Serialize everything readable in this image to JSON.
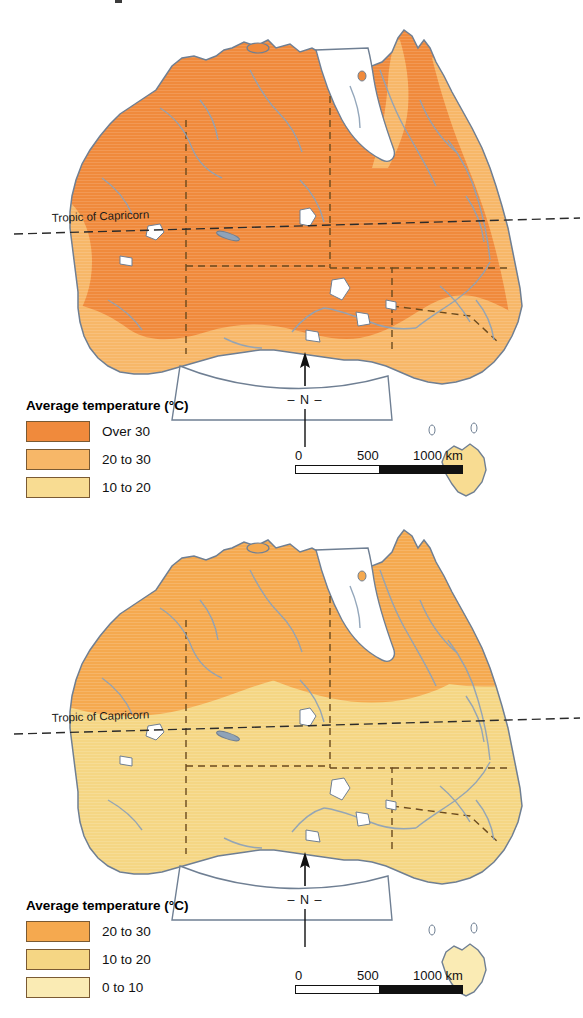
{
  "document": {
    "type": "thematic-map-figure",
    "subject": "Australia average temperature",
    "panel_count": 2
  },
  "panels": [
    {
      "id": "january",
      "month_label": "January",
      "legend": {
        "title": "Average temperature (°C)",
        "entries": [
          {
            "label": "Over 30",
            "color": "#F08A3C"
          },
          {
            "label": "20 to 30",
            "color": "#F7B768"
          },
          {
            "label": "10 to 20",
            "color": "#F8DC92"
          }
        ]
      },
      "annotations": {
        "tropic_label": "Tropic of Capricorn"
      },
      "north_arrow": {
        "left_dash": "–",
        "label": "N",
        "right_dash": "–"
      },
      "scalebar": {
        "tick_0": "0",
        "tick_1": "500",
        "tick_2": "1000 km"
      }
    },
    {
      "id": "july",
      "month_label": "July",
      "legend": {
        "title": "Average temperature (°C)",
        "entries": [
          {
            "label": "20 to 30",
            "color": "#F5A94F"
          },
          {
            "label": "10 to 20",
            "color": "#F5D684"
          },
          {
            "label": "0 to 10",
            "color": "#FAEBB4"
          }
        ]
      },
      "annotations": {
        "tropic_label": "Tropic of Capricorn"
      },
      "north_arrow": {
        "left_dash": "–",
        "label": "N",
        "right_dash": "–"
      },
      "scalebar": {
        "tick_0": "0",
        "tick_1": "500",
        "tick_2": "1000 km"
      }
    }
  ],
  "colors": {
    "over_30": "#F08A3C",
    "twenty_to_thirty": "#F7B768",
    "ten_to_twenty": "#F8DC92",
    "zero_to_ten": "#FAEBB4",
    "july_band_orange": "#F5A94F",
    "july_band_yellow": "#F5D684",
    "coastline": "#6f7f93",
    "river": "#8FA3B8",
    "state_border": "#6b4a1e",
    "lake": "#ffffff",
    "background": "#ffffff"
  }
}
